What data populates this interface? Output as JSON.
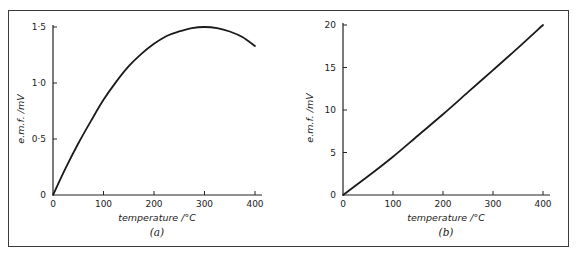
{
  "chart_data": [
    {
      "id": "a",
      "type": "line",
      "caption": "(a)",
      "title": "",
      "xlabel": "temperature  /°C",
      "ylabel": "e.m.f.  /mV",
      "xlim": [
        0,
        400
      ],
      "ylim": [
        0,
        1.5
      ],
      "x_ticks": [
        0,
        100,
        200,
        300,
        400
      ],
      "x_tick_labels": [
        "0",
        "100",
        "200",
        "300",
        "400"
      ],
      "y_ticks": [
        0,
        0.5,
        1.0,
        1.5
      ],
      "y_tick_labels": [
        "0",
        "0·5",
        "1·0",
        "1·5"
      ],
      "grid": false,
      "legend": null,
      "series": [
        {
          "name": "e.m.f.",
          "x": [
            0,
            25,
            50,
            75,
            100,
            125,
            150,
            175,
            200,
            225,
            250,
            275,
            300,
            325,
            350,
            375,
            400
          ],
          "y": [
            0,
            0.24,
            0.46,
            0.66,
            0.85,
            1.01,
            1.15,
            1.26,
            1.35,
            1.42,
            1.46,
            1.49,
            1.5,
            1.49,
            1.46,
            1.41,
            1.33
          ]
        }
      ]
    },
    {
      "id": "b",
      "type": "line",
      "caption": "(b)",
      "title": "",
      "xlabel": "temperature  /°C",
      "ylabel": "e.m.f.  /mV",
      "xlim": [
        0,
        400
      ],
      "ylim": [
        0,
        20
      ],
      "x_ticks": [
        0,
        100,
        200,
        300,
        400
      ],
      "x_tick_labels": [
        "0",
        "100",
        "200",
        "300",
        "400"
      ],
      "y_ticks": [
        0,
        5,
        10,
        15,
        20
      ],
      "y_tick_labels": [
        "0",
        "5",
        "10",
        "15",
        "20"
      ],
      "grid": false,
      "legend": null,
      "series": [
        {
          "name": "e.m.f.",
          "x": [
            0,
            50,
            100,
            150,
            200,
            250,
            300,
            350,
            400
          ],
          "y": [
            0,
            2.2,
            4.5,
            7.0,
            9.5,
            12.1,
            14.7,
            17.3,
            20.0
          ]
        }
      ]
    }
  ]
}
